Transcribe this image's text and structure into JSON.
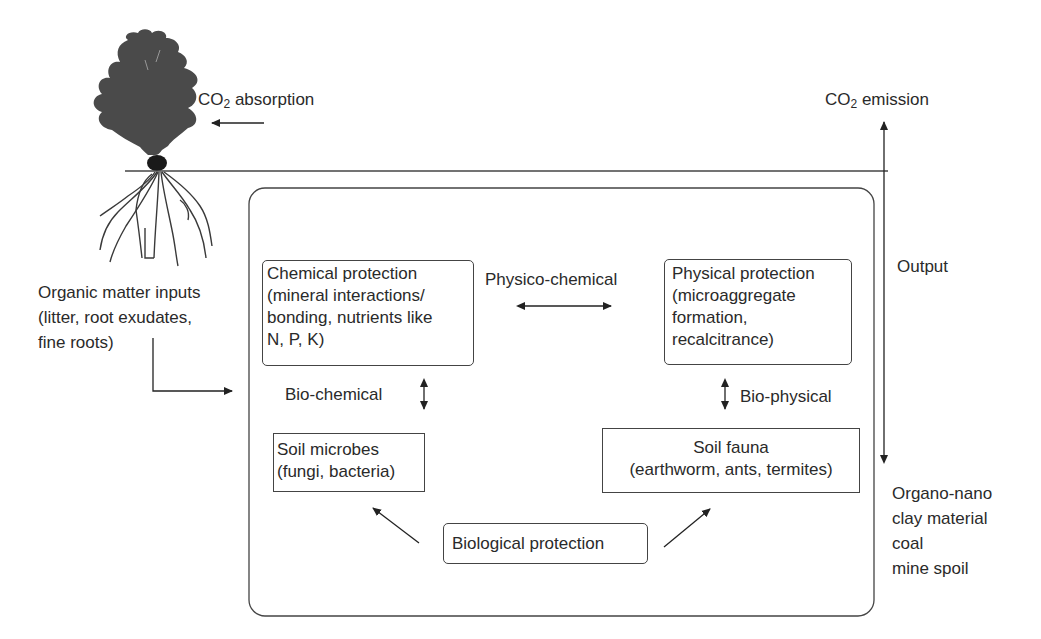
{
  "diagram": {
    "above_ground": {
      "co2_absorption": {
        "prefix": "CO",
        "sub": "2",
        "suffix": " absorption"
      },
      "co2_emission": {
        "prefix": "CO",
        "sub": "2",
        "suffix": " emission"
      }
    },
    "inputs": {
      "lines": [
        "Organic matter inputs",
        "(litter, root exudates,",
        "fine roots)"
      ]
    },
    "output": {
      "label": "Output",
      "products": [
        "Organo-nano",
        "clay material",
        "coal",
        "mine spoil"
      ]
    },
    "nodes": {
      "chemical": {
        "lines": [
          "Chemical protection",
          "(mineral interactions/",
          "bonding, nutrients like",
          "N, P, K)"
        ]
      },
      "physical": {
        "lines": [
          "Physical protection",
          "(microaggregate",
          "formation,",
          "recalcitrance)"
        ]
      },
      "microbes": {
        "lines": [
          "Soil microbes",
          "(fungi, bacteria)"
        ]
      },
      "fauna": {
        "lines": [
          "Soil fauna",
          "(earthworm, ants, termites)"
        ]
      },
      "biological": {
        "lines": [
          "Biological protection"
        ]
      }
    },
    "links": {
      "physico_chemical": "Physico-chemical",
      "bio_chemical": "Bio-chemical",
      "bio_physical": "Bio-physical"
    },
    "colors": {
      "ink": "#2a2a2a",
      "line": "#444444",
      "tree": "#4a4a4a",
      "background": "#ffffff"
    }
  }
}
